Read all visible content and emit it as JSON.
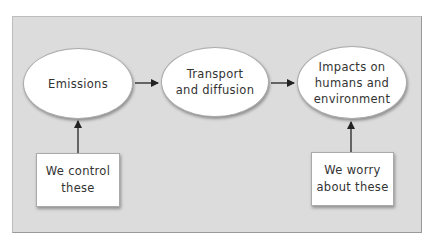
{
  "diagram": {
    "nodes": {
      "emissions": {
        "label": "Emissions",
        "shape": "ellipse"
      },
      "transport": {
        "label": "Transport\nand diffusion",
        "shape": "ellipse"
      },
      "impacts": {
        "label": "Impacts on\nhumans and\nenvironment",
        "shape": "ellipse"
      },
      "control": {
        "label": "We control\nthese",
        "shape": "box"
      },
      "worry": {
        "label": "We worry\nabout these",
        "shape": "box"
      }
    },
    "edges": [
      {
        "from": "emissions",
        "to": "transport"
      },
      {
        "from": "transport",
        "to": "impacts"
      },
      {
        "from": "control",
        "to": "emissions"
      },
      {
        "from": "worry",
        "to": "impacts"
      }
    ],
    "colors": {
      "panel": "#dcdcdc",
      "node_fill": "#ffffff",
      "arrow": "#222222",
      "text": "#333333"
    }
  }
}
